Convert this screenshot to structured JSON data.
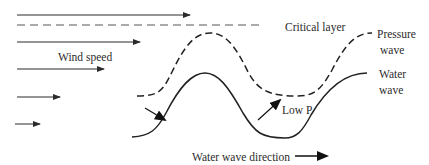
{
  "diagram": {
    "colors": {
      "stroke": "#2b2b2b",
      "background": "#ffffff"
    },
    "labels": {
      "critical_layer": "Critical layer",
      "wind_speed": "Wind speed",
      "pressure_wave_line1": "Pressure",
      "pressure_wave_line2": "wave",
      "water_wave_line1": "Water",
      "water_wave_line2": "wave",
      "low_p": "Low P",
      "water_wave_direction": "Water wave direction"
    },
    "wind_arrows": [
      {
        "y": 15,
        "x1": 17,
        "x2": 190
      },
      {
        "y": 42,
        "x1": 17,
        "x2": 140
      },
      {
        "y": 69,
        "x1": 17,
        "x2": 104
      },
      {
        "y": 97,
        "x1": 17,
        "x2": 60
      },
      {
        "y": 124,
        "x1": 15,
        "x2": 40
      }
    ],
    "critical_layer_line": {
      "y": 25,
      "x1": 17,
      "x2": 262
    },
    "curves": {
      "pressure_wave": "dashed",
      "water_wave": "solid"
    }
  }
}
